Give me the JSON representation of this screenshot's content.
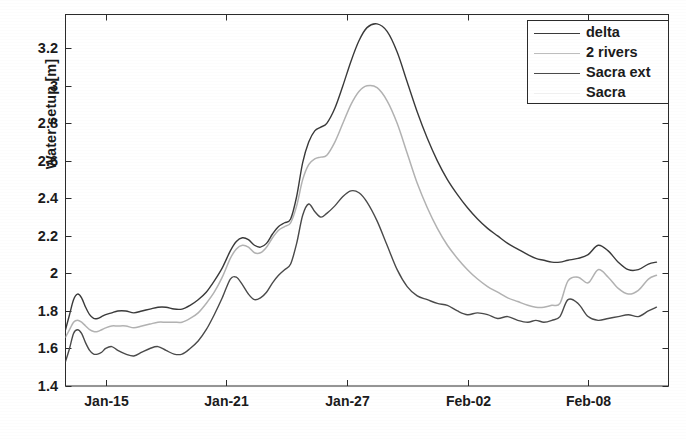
{
  "chart_data": {
    "type": "line",
    "title": "",
    "xlabel": "",
    "ylabel": "Water setup [m]",
    "grid": false,
    "legend_position": "top-right",
    "ylim": [
      1.4,
      3.38
    ],
    "yticks": [
      1.4,
      1.6,
      1.8,
      2.0,
      2.2,
      2.4,
      2.6,
      2.8,
      3.0,
      3.2
    ],
    "ytick_labels": [
      "1.4",
      "1.6",
      "1.8",
      "2",
      "2.2",
      "2.4",
      "2.6",
      "2.8",
      "3",
      "3.2"
    ],
    "xlim": [
      "Jan-13",
      "Feb-12"
    ],
    "xticks": [
      2,
      8,
      14,
      20,
      26
    ],
    "xtick_labels": [
      "Jan-15",
      "Jan-21",
      "Jan-27",
      "Feb-02",
      "Feb-08"
    ],
    "x_unit": "days from Jan-13",
    "series": [
      {
        "name": "delta",
        "color": "#3a3a3a",
        "peak_value": 3.33,
        "final_value": 2.06,
        "x": [
          0.0,
          0.2,
          0.4,
          0.6,
          0.8,
          1.0,
          1.2,
          1.4,
          1.6,
          1.8,
          2.0,
          2.3,
          2.6,
          3.0,
          3.4,
          3.8,
          4.2,
          4.6,
          5.0,
          5.4,
          5.8,
          6.2,
          6.6,
          7.0,
          7.4,
          7.8,
          8.2,
          8.5,
          8.8,
          9.1,
          9.4,
          9.7,
          10.0,
          10.3,
          10.6,
          10.9,
          11.2,
          11.5,
          11.8,
          12.1,
          12.4,
          12.7,
          13.0,
          13.4,
          13.8,
          14.2,
          14.6,
          15.0,
          15.5,
          16.0,
          16.5,
          17.0,
          17.5,
          18.0,
          18.5,
          19.0,
          19.5,
          20.0,
          20.5,
          21.0,
          21.5,
          22.0,
          22.5,
          23.0,
          23.4,
          23.8,
          24.2,
          24.6,
          25.0,
          25.5,
          26.0,
          26.5,
          27.0,
          27.5,
          28.0,
          28.5,
          29.0,
          29.4
        ],
        "values": [
          1.7,
          1.78,
          1.86,
          1.89,
          1.87,
          1.82,
          1.78,
          1.76,
          1.76,
          1.77,
          1.78,
          1.79,
          1.8,
          1.8,
          1.79,
          1.8,
          1.81,
          1.82,
          1.82,
          1.81,
          1.81,
          1.83,
          1.86,
          1.9,
          1.96,
          2.03,
          2.12,
          2.17,
          2.19,
          2.18,
          2.15,
          2.14,
          2.16,
          2.21,
          2.25,
          2.27,
          2.29,
          2.41,
          2.59,
          2.7,
          2.76,
          2.78,
          2.8,
          2.88,
          3.0,
          3.13,
          3.24,
          3.31,
          3.33,
          3.29,
          3.18,
          3.02,
          2.86,
          2.72,
          2.6,
          2.5,
          2.42,
          2.35,
          2.29,
          2.24,
          2.2,
          2.16,
          2.13,
          2.1,
          2.08,
          2.07,
          2.06,
          2.06,
          2.07,
          2.08,
          2.1,
          2.15,
          2.12,
          2.06,
          2.02,
          2.02,
          2.05,
          2.06
        ]
      },
      {
        "name": "2 rivers",
        "color": "#b2b2b2",
        "peak_value": 3.0,
        "final_value": 1.99,
        "x": [
          0.0,
          0.2,
          0.4,
          0.6,
          0.8,
          1.0,
          1.2,
          1.4,
          1.6,
          1.8,
          2.0,
          2.3,
          2.6,
          3.0,
          3.4,
          3.8,
          4.2,
          4.6,
          5.0,
          5.4,
          5.8,
          6.2,
          6.6,
          7.0,
          7.4,
          7.8,
          8.2,
          8.5,
          8.8,
          9.1,
          9.4,
          9.7,
          10.0,
          10.3,
          10.6,
          10.9,
          11.2,
          11.5,
          11.8,
          12.1,
          12.4,
          12.7,
          13.0,
          13.4,
          13.8,
          14.2,
          14.6,
          15.0,
          15.5,
          16.0,
          16.5,
          17.0,
          17.5,
          18.0,
          18.5,
          19.0,
          19.5,
          20.0,
          20.5,
          21.0,
          21.5,
          22.0,
          22.5,
          23.0,
          23.4,
          23.8,
          24.2,
          24.6,
          25.0,
          25.5,
          26.0,
          26.5,
          27.0,
          27.5,
          28.0,
          28.5,
          29.0,
          29.4
        ],
        "values": [
          1.66,
          1.7,
          1.74,
          1.75,
          1.74,
          1.72,
          1.7,
          1.69,
          1.69,
          1.7,
          1.71,
          1.72,
          1.72,
          1.72,
          1.71,
          1.72,
          1.73,
          1.74,
          1.74,
          1.74,
          1.74,
          1.76,
          1.79,
          1.84,
          1.9,
          1.98,
          2.08,
          2.13,
          2.15,
          2.14,
          2.11,
          2.11,
          2.14,
          2.19,
          2.23,
          2.25,
          2.27,
          2.36,
          2.5,
          2.58,
          2.61,
          2.62,
          2.63,
          2.7,
          2.8,
          2.9,
          2.97,
          3.0,
          2.99,
          2.92,
          2.8,
          2.64,
          2.48,
          2.35,
          2.24,
          2.15,
          2.08,
          2.02,
          1.97,
          1.93,
          1.9,
          1.87,
          1.85,
          1.83,
          1.82,
          1.82,
          1.83,
          1.84,
          1.96,
          1.98,
          1.95,
          2.02,
          1.98,
          1.92,
          1.89,
          1.91,
          1.97,
          1.99
        ]
      },
      {
        "name": "Sacra ext",
        "color": "#4a4a4a",
        "peak_value": 2.44,
        "final_value": 1.82,
        "x": [
          0.0,
          0.2,
          0.4,
          0.6,
          0.8,
          1.0,
          1.2,
          1.4,
          1.6,
          1.8,
          2.0,
          2.3,
          2.6,
          3.0,
          3.4,
          3.8,
          4.2,
          4.6,
          5.0,
          5.4,
          5.8,
          6.2,
          6.6,
          7.0,
          7.4,
          7.8,
          8.2,
          8.5,
          8.8,
          9.1,
          9.4,
          9.7,
          10.0,
          10.3,
          10.6,
          10.9,
          11.2,
          11.5,
          11.8,
          12.1,
          12.4,
          12.7,
          13.0,
          13.4,
          13.8,
          14.2,
          14.6,
          15.0,
          15.5,
          16.0,
          16.5,
          17.0,
          17.5,
          18.0,
          18.5,
          19.0,
          19.5,
          20.0,
          20.5,
          21.0,
          21.5,
          22.0,
          22.5,
          23.0,
          23.4,
          23.8,
          24.2,
          24.6,
          25.0,
          25.5,
          26.0,
          26.5,
          27.0,
          27.5,
          28.0,
          28.5,
          29.0,
          29.4
        ],
        "values": [
          1.53,
          1.6,
          1.68,
          1.7,
          1.68,
          1.63,
          1.59,
          1.57,
          1.57,
          1.58,
          1.6,
          1.61,
          1.59,
          1.57,
          1.56,
          1.58,
          1.6,
          1.61,
          1.59,
          1.57,
          1.57,
          1.6,
          1.64,
          1.7,
          1.78,
          1.87,
          1.97,
          1.98,
          1.94,
          1.89,
          1.86,
          1.87,
          1.9,
          1.95,
          1.99,
          2.02,
          2.05,
          2.16,
          2.31,
          2.37,
          2.33,
          2.3,
          2.32,
          2.36,
          2.41,
          2.44,
          2.43,
          2.38,
          2.28,
          2.15,
          2.02,
          1.93,
          1.88,
          1.86,
          1.84,
          1.83,
          1.8,
          1.78,
          1.79,
          1.78,
          1.76,
          1.77,
          1.75,
          1.74,
          1.75,
          1.74,
          1.75,
          1.77,
          1.86,
          1.84,
          1.77,
          1.75,
          1.76,
          1.77,
          1.78,
          1.77,
          1.8,
          1.82
        ]
      },
      {
        "name": "Sacra",
        "color": "#eeeeee",
        "peak_value": null,
        "final_value": null,
        "x": [],
        "values": []
      }
    ]
  },
  "legend": {
    "entries": [
      {
        "label": "delta"
      },
      {
        "label": "2 rivers"
      },
      {
        "label": "Sacra ext"
      },
      {
        "label": "Sacra"
      }
    ]
  },
  "caption": {
    "text": ""
  }
}
